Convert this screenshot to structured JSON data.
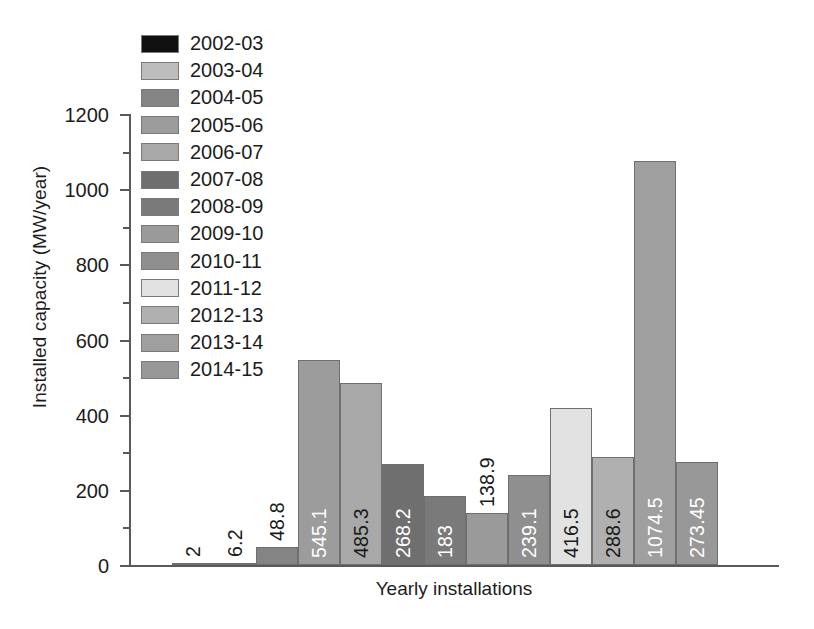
{
  "chart_data": {
    "type": "bar",
    "title": "",
    "xlabel": "Yearly installations",
    "ylabel": "Installed capacity (MW/year)",
    "ylim": [
      0,
      1200
    ],
    "ytick_labels": [
      "0",
      "200",
      "400",
      "600",
      "800",
      "1000",
      "1200"
    ],
    "ytick_values": [
      0,
      200,
      400,
      600,
      800,
      1000,
      1200
    ],
    "yminor_values": [
      100,
      300,
      500,
      700,
      900,
      1100
    ],
    "grid": false,
    "legend_position": "upper-left-inside",
    "categories": [
      "2002-03",
      "2003-04",
      "2004-05",
      "2005-06",
      "2006-07",
      "2007-08",
      "2008-09",
      "2009-10",
      "2010-11",
      "2011-12",
      "2012-13",
      "2013-14",
      "2014-15"
    ],
    "values": [
      2,
      6.2,
      48.8,
      545.1,
      485.3,
      268.2,
      183,
      138.9,
      239.1,
      416.5,
      288.6,
      1074.5,
      273.45
    ],
    "value_labels": [
      "2",
      "6.2",
      "48.8",
      "545.1",
      "485.3",
      "268.2",
      "183",
      "138.9",
      "239.1",
      "416.5",
      "288.6",
      "1074.5",
      "273.45"
    ],
    "colors": [
      "#111111",
      "#bdbdbd",
      "#848484",
      "#9c9c9c",
      "#a8a8a8",
      "#6f6f6f",
      "#7a7a7a",
      "#9a9a9a",
      "#8f8f8f",
      "#e2e2e2",
      "#b0b0b0",
      "#9f9f9f",
      "#989898"
    ]
  },
  "legend": {
    "items": [
      {
        "label": "2002-03",
        "color": "#111111"
      },
      {
        "label": "2003-04",
        "color": "#bdbdbd"
      },
      {
        "label": "2004-05",
        "color": "#848484"
      },
      {
        "label": "2005-06",
        "color": "#9c9c9c"
      },
      {
        "label": "2006-07",
        "color": "#a8a8a8"
      },
      {
        "label": "2007-08",
        "color": "#6f6f6f"
      },
      {
        "label": "2008-09",
        "color": "#7a7a7a"
      },
      {
        "label": "2009-10",
        "color": "#9a9a9a"
      },
      {
        "label": "2010-11",
        "color": "#8f8f8f"
      },
      {
        "label": "2011-12",
        "color": "#e2e2e2"
      },
      {
        "label": "2012-13",
        "color": "#b0b0b0"
      },
      {
        "label": "2013-14",
        "color": "#9f9f9f"
      },
      {
        "label": "2014-15",
        "color": "#989898"
      }
    ]
  },
  "axes": {
    "y_title": "Installed capacity (MW/year)",
    "x_title": "Yearly installations"
  }
}
